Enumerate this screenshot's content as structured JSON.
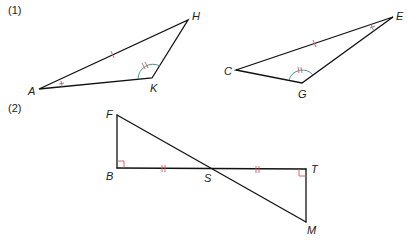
{
  "figure": {
    "parts": [
      {
        "label": "(1)"
      },
      {
        "label": "(2)"
      }
    ],
    "part1": {
      "triangle1": {
        "vertices": [
          "A",
          "K",
          "H"
        ]
      },
      "triangle2": {
        "vertices": [
          "C",
          "G",
          "E"
        ]
      },
      "markings": {
        "equal_sides": [
          "AH",
          "CE"
        ],
        "equal_angles_single": [
          "A",
          "E"
        ],
        "equal_angles_double": [
          "K",
          "G"
        ]
      }
    },
    "part2": {
      "points": [
        "F",
        "B",
        "S",
        "T",
        "M"
      ],
      "markings": {
        "right_angles": [
          "B",
          "T"
        ],
        "equal_segments": [
          "BS",
          "ST"
        ]
      }
    },
    "colors": {
      "lines": "#111111",
      "tick_marks": "#d25a5a",
      "angle_arcs": "#3a8a8a"
    }
  }
}
